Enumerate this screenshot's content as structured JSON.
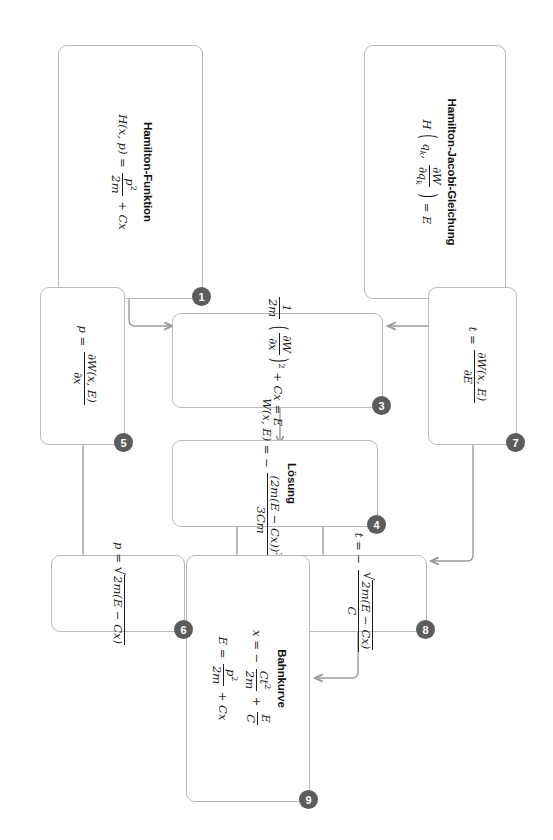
{
  "diagram": {
    "language": "de",
    "orientation": "rotated-90-clockwise",
    "accent_badge_color": "#5c5c5c",
    "border_color": "#b9b9b9",
    "edge_color": "#9b9b9b",
    "background": "#ffffff"
  },
  "nodes": [
    {
      "id": "n1",
      "badge": "1",
      "title": "Hamilton-Funktion",
      "formula_html": "H(x, p) = <span class=\"frac\"><span class=\"num\">p<span class=\"sup\">2</span></span><span class=\"den\">2m</span></span> + Cx"
    },
    {
      "id": "n2",
      "badge": "2",
      "title": "Hamilton-Jacobi-Gleichung",
      "formula_html": "H <span class=\"paren\">(</span> q<span class=\"sub\">k</span>, <span class=\"frac\"><span class=\"num\">&#8706;W</span><span class=\"den\">&#8706;q<span class=\"sub\">k</span></span></span> <span class=\"paren\">)</span> = E"
    },
    {
      "id": "n3",
      "badge": "3",
      "title": "",
      "formula_html": "<span class=\"frac\"><span class=\"num\">1</span><span class=\"den\">2m</span></span> <span class=\"paren\">(</span><span class=\"frac\"><span class=\"num\">&#8706;W</span><span class=\"den\">&#8706;x</span></span><span class=\"paren\">)</span><span class=\"sup\">2</span> + Cx = E"
    },
    {
      "id": "n4",
      "badge": "4",
      "title": "Lösung",
      "formula_html": "W(x, E) = &minus; <span class=\"frac\"><span class=\"num\">(2m(E &minus; Cx))<span class=\"sup\">3/2</span></span><span class=\"den\">3Cm</span></span>"
    },
    {
      "id": "n5",
      "badge": "5",
      "title": "",
      "formula_html": "p = <span class=\"frac\"><span class=\"num\">&#8706;W(x, E)</span><span class=\"den\">&#8706;x</span></span>"
    },
    {
      "id": "n6",
      "badge": "6",
      "title": "",
      "formula_html": "p = <span class=\"rad\"><span class=\"sign\">&radic;</span><span class=\"body\">2m(E &minus; Cx)</span></span>"
    },
    {
      "id": "n7",
      "badge": "7",
      "title": "",
      "formula_html": "t = <span class=\"frac\"><span class=\"num\">&#8706;W(x, E)</span><span class=\"den\">&#8706;E</span></span>"
    },
    {
      "id": "n8",
      "badge": "8",
      "title": "",
      "formula_html": "t = &minus; <span class=\"frac\"><span class=\"num\"><span class=\"rad\"><span class=\"sign\">&radic;</span><span class=\"body\">2m(E &minus; Cx)</span></span></span><span class=\"den\">C</span></span>"
    },
    {
      "id": "n9",
      "badge": "9",
      "title": "Bahnkurve",
      "formula_html": "x = &minus; <span class=\"frac\"><span class=\"num\">Ct<span class=\"sup\">2</span></span><span class=\"den\">2m</span></span> + <span class=\"frac\"><span class=\"num\">E</span><span class=\"den\">C</span></span>",
      "formula2_html": "E = <span class=\"frac\"><span class=\"num\">p<span class=\"sup\">2</span></span><span class=\"den\">2m</span></span> + Cx"
    }
  ],
  "edges": [
    {
      "from": "n2",
      "to": "n3",
      "label": ""
    },
    {
      "from": "n1",
      "to": "n3",
      "label": ""
    },
    {
      "from": "n3",
      "to": "n4",
      "label": ""
    },
    {
      "from": "n4",
      "to": "n8",
      "label": ""
    },
    {
      "from": "n4",
      "to": "n6",
      "label": ""
    },
    {
      "from": "n7",
      "to": "n8",
      "label": ""
    },
    {
      "from": "n5",
      "to": "n6",
      "label": ""
    },
    {
      "from": "n8",
      "to": "n9",
      "label": ""
    },
    {
      "from": "n6",
      "to": "n9",
      "label": ""
    }
  ]
}
